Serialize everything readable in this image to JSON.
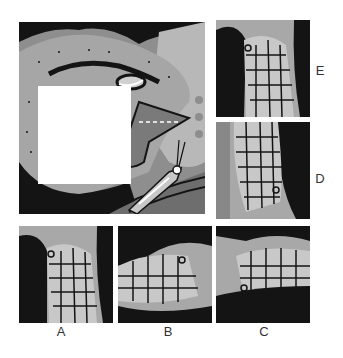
{
  "puzzle": {
    "main_image": {
      "description": "lizard head with grasshopper, missing square patch",
      "missing_patch": {
        "x": 19,
        "y": 64,
        "w": 93,
        "h": 98
      }
    },
    "options": [
      {
        "id": "A",
        "label": "A"
      },
      {
        "id": "B",
        "label": "B"
      },
      {
        "id": "C",
        "label": "C"
      },
      {
        "id": "D",
        "label": "D"
      },
      {
        "id": "E",
        "label": "E"
      }
    ]
  },
  "colors": {
    "black": "#141414",
    "dark_gray": "#6e6e6e",
    "mid_gray": "#8e8e8e",
    "light_gray": "#b8b8b8",
    "white": "#ffffff"
  }
}
